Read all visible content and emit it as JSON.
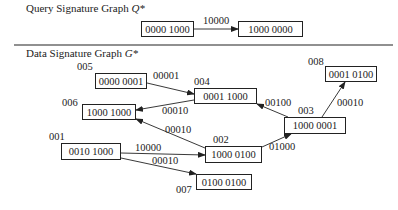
{
  "query": {
    "title": "Query  Signature Graph ",
    "title_symbol": "Q*",
    "nodes": [
      {
        "sig": "0000 1000"
      },
      {
        "sig": "1000 0000"
      }
    ],
    "edges": [
      {
        "label": "10000",
        "from": 0,
        "to": 1
      }
    ]
  },
  "data_graph": {
    "title": "Data Signature Graph ",
    "title_symbol": "G*",
    "nodes": [
      {
        "id": "001",
        "sig": "0010 1000"
      },
      {
        "id": "002",
        "sig": "1000 0100"
      },
      {
        "id": "003",
        "sig": "1000 0001"
      },
      {
        "id": "004",
        "sig": "0001 1000"
      },
      {
        "id": "005",
        "sig": "0000 0001"
      },
      {
        "id": "006",
        "sig": "1000 1000"
      },
      {
        "id": "007",
        "sig": "0100 0100"
      },
      {
        "id": "008",
        "sig": "0001 0100"
      }
    ],
    "edges": [
      {
        "from": "005",
        "to": "004",
        "label": "00001"
      },
      {
        "from": "004",
        "to": "006",
        "label": "00010"
      },
      {
        "from": "002",
        "to": "006",
        "label": "00010"
      },
      {
        "from": "003",
        "to": "004",
        "label": "00100"
      },
      {
        "from": "003",
        "to": "008",
        "label": "00010"
      },
      {
        "from": "002",
        "to": "003",
        "label": "01000"
      },
      {
        "from": "001",
        "to": "002",
        "label": "10000"
      },
      {
        "from": "001",
        "to": "007",
        "label": "00010"
      }
    ]
  }
}
